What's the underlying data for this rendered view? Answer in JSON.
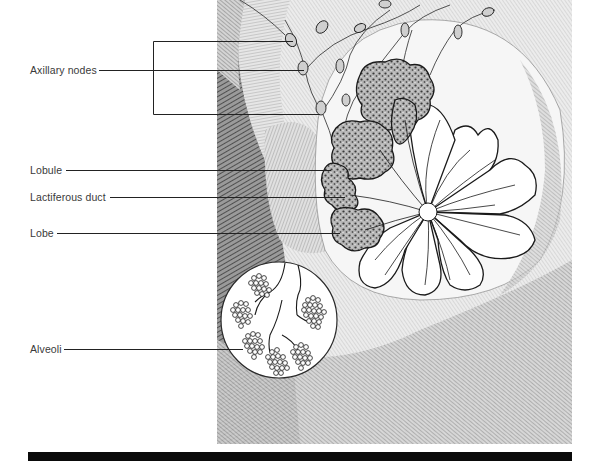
{
  "diagram": {
    "labels": [
      {
        "id": "axillary-nodes",
        "text": "Axillary nodes"
      },
      {
        "id": "lobule",
        "text": "Lobule"
      },
      {
        "id": "lactiferous-duct",
        "text": "Lactiferous duct"
      },
      {
        "id": "lobe",
        "text": "Lobe"
      },
      {
        "id": "alveoli",
        "text": "Alveoli"
      }
    ],
    "colors": {
      "text": "#3a3a3a",
      "leader_line": "#222222",
      "bar": "#0a0a0a",
      "ink": "#1a1a1a",
      "shade": "#8a8a8a"
    }
  }
}
